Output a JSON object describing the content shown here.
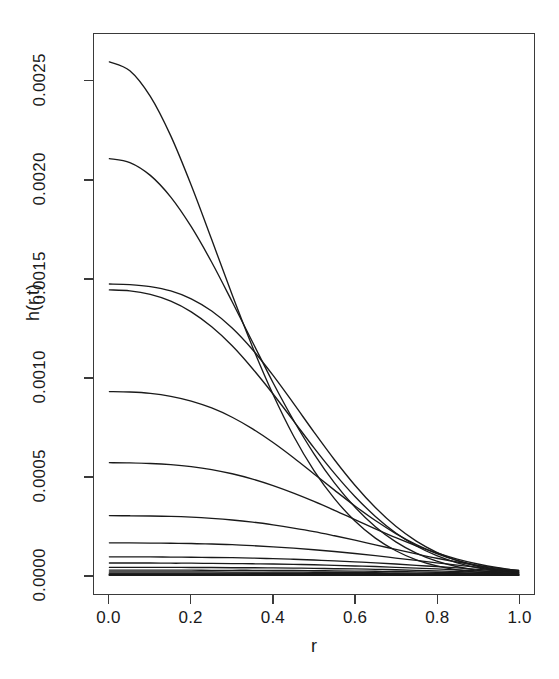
{
  "chart_data": {
    "type": "line",
    "title": "",
    "xlabel": "r",
    "ylabel": "h(r,t)",
    "xlim": [
      0.0,
      1.0
    ],
    "ylim": [
      0.0,
      0.00268
    ],
    "grid": false,
    "legend": "none",
    "box": true,
    "xticks": [
      "0.0",
      "0.2",
      "0.4",
      "0.6",
      "0.8",
      "1.0"
    ],
    "xtick_values": [
      0.0,
      0.2,
      0.4,
      0.6,
      0.8,
      1.0
    ],
    "yticks": [
      "0.0000",
      "0.0005",
      "0.0010",
      "0.0015",
      "0.0020",
      "0.0025"
    ],
    "ytick_values": [
      0.0,
      0.0005,
      0.001,
      0.0015,
      0.002,
      0.0025
    ],
    "line_color": "#1a1a1a",
    "x": [
      0.0,
      0.05,
      0.1,
      0.15,
      0.2,
      0.25,
      0.3,
      0.35,
      0.4,
      0.45,
      0.5,
      0.55,
      0.6,
      0.65,
      0.7,
      0.75,
      0.8,
      0.85,
      0.9,
      0.95,
      1.0
    ],
    "series": [
      {
        "name": "t1",
        "peak": 0.0026,
        "values": [
          0.0026,
          0.002555,
          0.002425,
          0.002225,
          0.001975,
          0.0017,
          0.00142,
          0.001155,
          0.000915,
          0.000705,
          0.00053,
          0.000388,
          0.000275,
          0.000188,
          0.000124,
          7.8e-05,
          4.7e-05,
          2.7e-05,
          1.5e-05,
          8e-06,
          4e-06
        ]
      },
      {
        "name": "t2",
        "peak": 0.00211,
        "values": [
          0.00211,
          0.00209,
          0.002025,
          0.001915,
          0.001765,
          0.001585,
          0.001385,
          0.00118,
          0.000975,
          0.000785,
          0.000615,
          0.000468,
          0.000345,
          0.000246,
          0.000169,
          0.000112,
          7.1e-05,
          4.3e-05,
          2.5e-05,
          1.4e-05,
          7e-06
        ]
      },
      {
        "name": "t3",
        "peak": 0.001475,
        "values": [
          0.001475,
          0.001472,
          0.001462,
          0.00144,
          0.0014,
          0.001338,
          0.001252,
          0.001142,
          0.001012,
          0.00087,
          0.000725,
          0.000585,
          0.000456,
          0.000343,
          0.000248,
          0.000173,
          0.000116,
          7.4e-05,
          4.5e-05,
          2.6e-05,
          1.4e-05
        ]
      },
      {
        "name": "t4",
        "peak": 0.001445,
        "values": [
          0.001445,
          0.00144,
          0.001422,
          0.001388,
          0.001334,
          0.001258,
          0.001162,
          0.001046,
          0.000918,
          0.000782,
          0.000645,
          0.000516,
          0.000399,
          0.000298,
          0.000214,
          0.000148,
          9.9e-05,
          6.3e-05,
          3.8e-05,
          2.2e-05,
          1.2e-05
        ]
      },
      {
        "name": "t5",
        "peak": 0.00093,
        "values": [
          0.00093,
          0.000928,
          0.000921,
          0.000906,
          0.000882,
          0.000847,
          0.0008,
          0.000741,
          0.000672,
          0.000595,
          0.000513,
          0.000431,
          0.000351,
          0.000277,
          0.000211,
          0.000155,
          0.00011,
          7.5e-05,
          4.9e-05,
          3e-05,
          1.8e-05
        ]
      },
      {
        "name": "t6",
        "peak": 0.00057,
        "values": [
          0.00057,
          0.000569,
          0.000566,
          0.00056,
          0.00055,
          0.000535,
          0.000514,
          0.000487,
          0.000454,
          0.000416,
          0.000374,
          0.000329,
          0.000282,
          0.000235,
          0.00019,
          0.000149,
          0.000113,
          8.2e-05,
          5.7e-05,
          3.8e-05,
          2.4e-05
        ]
      },
      {
        "name": "t7",
        "peak": 0.000302,
        "values": [
          0.000302,
          0.000301,
          0.0003,
          0.000298,
          0.000294,
          0.000288,
          0.00028,
          0.000269,
          0.000255,
          0.000239,
          0.000221,
          0.0002,
          0.000178,
          0.000154,
          0.000131,
          0.000108,
          8.6e-05,
          6.7e-05,
          5e-05,
          3.5e-05,
          2.4e-05
        ]
      },
      {
        "name": "t8",
        "peak": 0.000164,
        "values": [
          0.000164,
          0.000164,
          0.000163,
          0.000162,
          0.000161,
          0.000158,
          0.000155,
          0.00015,
          0.000144,
          0.000137,
          0.000129,
          0.00012,
          0.00011,
          9.9e-05,
          8.7e-05,
          7.5e-05,
          6.3e-05,
          5.1e-05,
          4e-05,
          3e-05,
          2.1e-05
        ]
      },
      {
        "name": "t9",
        "peak": 9.3e-05,
        "values": [
          9.3e-05,
          9.3e-05,
          9.3e-05,
          9.2e-05,
          9.1e-05,
          9e-05,
          8.9e-05,
          8.7e-05,
          8.4e-05,
          8.1e-05,
          7.7e-05,
          7.3e-05,
          6.8e-05,
          6.3e-05,
          5.7e-05,
          5e-05,
          4.4e-05,
          3.7e-05,
          3e-05,
          2.3e-05,
          1.7e-05
        ]
      },
      {
        "name": "t10",
        "peak": 6.2e-05,
        "values": [
          6.2e-05,
          6.2e-05,
          6.2e-05,
          6.1e-05,
          6.1e-05,
          6e-05,
          5.9e-05,
          5.8e-05,
          5.7e-05,
          5.5e-05,
          5.3e-05,
          5e-05,
          4.7e-05,
          4.4e-05,
          4e-05,
          3.6e-05,
          3.2e-05,
          2.7e-05,
          2.2e-05,
          1.8e-05,
          1.3e-05
        ]
      },
      {
        "name": "t11",
        "peak": 4e-05,
        "values": [
          4e-05,
          4e-05,
          4e-05,
          4e-05,
          3.9e-05,
          3.9e-05,
          3.8e-05,
          3.8e-05,
          3.7e-05,
          3.6e-05,
          3.5e-05,
          3.3e-05,
          3.2e-05,
          3e-05,
          2.8e-05,
          2.5e-05,
          2.2e-05,
          1.9e-05,
          1.6e-05,
          1.3e-05,
          1e-05
        ]
      },
      {
        "name": "t12",
        "peak": 2.6e-05,
        "values": [
          2.6e-05,
          2.6e-05,
          2.6e-05,
          2.6e-05,
          2.6e-05,
          2.5e-05,
          2.5e-05,
          2.5e-05,
          2.4e-05,
          2.4e-05,
          2.3e-05,
          2.2e-05,
          2.1e-05,
          2e-05,
          1.9e-05,
          1.7e-05,
          1.5e-05,
          1.3e-05,
          1.1e-05,
          9e-06,
          7e-06
        ]
      },
      {
        "name": "t13",
        "peak": 1.7e-05,
        "values": [
          1.7e-05,
          1.7e-05,
          1.7e-05,
          1.7e-05,
          1.7e-05,
          1.7e-05,
          1.6e-05,
          1.6e-05,
          1.6e-05,
          1.6e-05,
          1.5e-05,
          1.5e-05,
          1.4e-05,
          1.3e-05,
          1.2e-05,
          1.1e-05,
          1e-05,
          9e-06,
          8e-06,
          6e-06,
          5e-06
        ]
      },
      {
        "name": "t14",
        "peak": 1.1e-05,
        "values": [
          1.1e-05,
          1.1e-05,
          1.1e-05,
          1.1e-05,
          1.1e-05,
          1.1e-05,
          1.1e-05,
          1e-05,
          1e-05,
          1e-05,
          1e-05,
          9e-06,
          9e-06,
          9e-06,
          8e-06,
          7e-06,
          7e-06,
          6e-06,
          5e-06,
          4e-06,
          3e-06
        ]
      },
      {
        "name": "t15",
        "peak": 7e-06,
        "values": [
          7e-06,
          7e-06,
          7e-06,
          7e-06,
          7e-06,
          7e-06,
          7e-06,
          7e-06,
          7e-06,
          6e-06,
          6e-06,
          6e-06,
          6e-06,
          6e-06,
          5e-06,
          5e-06,
          4e-06,
          4e-06,
          3e-06,
          3e-06,
          2e-06
        ]
      },
      {
        "name": "t16",
        "peak": 4e-06,
        "values": [
          4e-06,
          4e-06,
          4e-06,
          4e-06,
          4e-06,
          4e-06,
          4e-06,
          4e-06,
          4e-06,
          4e-06,
          4e-06,
          4e-06,
          3e-06,
          3e-06,
          3e-06,
          3e-06,
          3e-06,
          2e-06,
          2e-06,
          2e-06,
          1e-06
        ]
      },
      {
        "name": "t17",
        "peak": 2.5e-06,
        "values": [
          2.5e-06,
          2.5e-06,
          2.5e-06,
          2.5e-06,
          2.5e-06,
          2.4e-06,
          2.4e-06,
          2.4e-06,
          2.3e-06,
          2.3e-06,
          2.2e-06,
          2.1e-06,
          2e-06,
          1.9e-06,
          1.8e-06,
          1.6e-06,
          1.5e-06,
          1.3e-06,
          1.1e-06,
          9e-07,
          7e-07
        ]
      },
      {
        "name": "t18",
        "peak": 1.5e-06,
        "values": [
          1.5e-06,
          1.5e-06,
          1.5e-06,
          1.5e-06,
          1.5e-06,
          1.5e-06,
          1.4e-06,
          1.4e-06,
          1.4e-06,
          1.4e-06,
          1.3e-06,
          1.3e-06,
          1.2e-06,
          1.2e-06,
          1.1e-06,
          1e-06,
          9e-07,
          8e-07,
          7e-07,
          6e-07,
          4e-07
        ]
      },
      {
        "name": "t19",
        "peak": 9e-07,
        "values": [
          9e-07,
          9e-07,
          9e-07,
          9e-07,
          9e-07,
          9e-07,
          9e-07,
          8e-07,
          8e-07,
          8e-07,
          8e-07,
          8e-07,
          7e-07,
          7e-07,
          6e-07,
          6e-07,
          5e-07,
          5e-07,
          4e-07,
          3e-07,
          3e-07
        ]
      },
      {
        "name": "t20",
        "peak": 5e-07,
        "values": [
          5e-07,
          5e-07,
          5e-07,
          5e-07,
          5e-07,
          5e-07,
          5e-07,
          5e-07,
          5e-07,
          4e-07,
          4e-07,
          4e-07,
          4e-07,
          4e-07,
          4e-07,
          3e-07,
          3e-07,
          3e-07,
          2e-07,
          2e-07,
          1e-07
        ]
      }
    ]
  }
}
